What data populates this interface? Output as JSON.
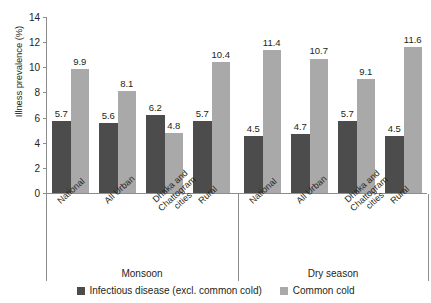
{
  "chart_data": {
    "type": "bar",
    "title": "",
    "xlabel": "",
    "ylabel": "Illness prevalence (%)",
    "ylim": [
      0,
      14
    ],
    "ytick_labels": [
      "0",
      "2",
      "4",
      "6",
      "8",
      "10",
      "12",
      "14"
    ],
    "ytick_values": [
      0,
      2,
      4,
      6,
      8,
      10,
      12,
      14
    ],
    "grid": false,
    "legend_position": "bottom",
    "group_labels": [
      "Monsoon",
      "Dry season"
    ],
    "categories": [
      "National",
      "All Urban",
      "Dhaka and Chattogram cities",
      "Rural",
      "National",
      "All Urban",
      "Dhaka and Chattogram cities",
      "Rural"
    ],
    "category_lines": [
      [
        "National"
      ],
      [
        "All Urban"
      ],
      [
        "Dhaka and",
        "Chattogram",
        "cities"
      ],
      [
        "Rural"
      ],
      [
        "National"
      ],
      [
        "All Urban"
      ],
      [
        "Dhaka and",
        "Chattogram",
        "cities"
      ],
      [
        "Rural"
      ]
    ],
    "series": [
      {
        "name": "Infectious disease (excl. common cold)",
        "color": "#4c4c4c",
        "values": [
          5.7,
          5.6,
          6.2,
          5.7,
          4.5,
          4.7,
          5.7,
          4.5
        ]
      },
      {
        "name": "Common cold",
        "color": "#a9a9a9",
        "values": [
          9.9,
          8.1,
          4.8,
          10.4,
          11.4,
          10.7,
          9.1,
          11.6
        ]
      }
    ]
  },
  "legend": {
    "items": [
      {
        "label": "Infectious disease (excl. common cold)",
        "color": "#4c4c4c"
      },
      {
        "label": "Common cold",
        "color": "#a9a9a9"
      }
    ]
  },
  "axis": {
    "y_title": "Illness prevalence (%)"
  },
  "colors": {
    "dark_bar": "#4c4c4c",
    "light_bar": "#a9a9a9",
    "axis": "#8d8d8d",
    "text": "#231f20",
    "background": "#ffffff"
  }
}
